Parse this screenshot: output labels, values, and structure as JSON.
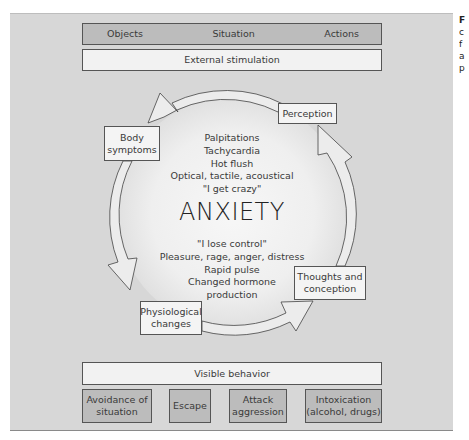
{
  "top": {
    "categories": [
      "Objects",
      "Situation",
      "Actions"
    ],
    "external_label": "External stimulation"
  },
  "cycle": {
    "center_title": "ANXIETY",
    "nodes": {
      "perception": "Perception",
      "body_symptoms": [
        "Body",
        "symptoms"
      ],
      "thoughts": [
        "Thoughts and",
        "conception"
      ],
      "physiological": [
        "Physiological",
        "changes"
      ]
    },
    "upper_lines": [
      "Palpitations",
      "Tachycardia",
      "Hot flush",
      "Optical, tactile, acoustical",
      "\"I get crazy\""
    ],
    "lower_lines": [
      "\"I lose control\"",
      "Pleasure, rage, anger, distress",
      "Rapid pulse",
      "Changed hormone",
      "production"
    ],
    "flow_direction": "counter-clockwise: Perception → Body symptoms → Physiological changes → Thoughts and conception → Perception"
  },
  "bottom": {
    "visible_label": "Visible behavior",
    "behaviors": [
      [
        "Avoidance of",
        "situation"
      ],
      [
        "Escape"
      ],
      [
        "Attack",
        "aggression"
      ],
      [
        "Intoxication",
        "(alcohol, drugs)"
      ]
    ]
  },
  "caption_fragments": [
    "F",
    "c",
    "f",
    "a",
    "p"
  ],
  "colors": {
    "panel": "#d7d7d7",
    "dark_box": "#bcbcbc",
    "light_box": "#f2f2f2",
    "border": "#555555",
    "ring_fill": "#ececec"
  }
}
